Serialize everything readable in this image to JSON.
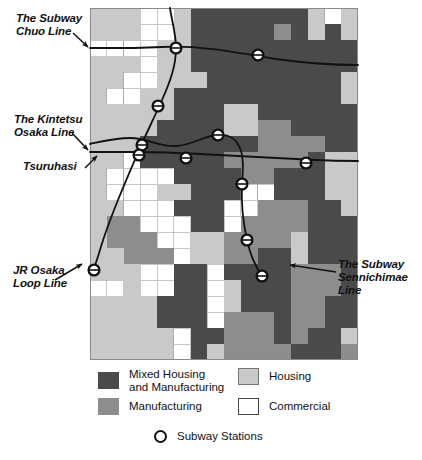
{
  "figure": {
    "map_bounds": {
      "left": 90,
      "top": 8,
      "width": 268,
      "height": 352
    },
    "grid": {
      "cols": 16,
      "rows": 22
    }
  },
  "labels": {
    "chuo": "The Subway\nChuo Line",
    "kintetsu": "The Kintetsu\nOsaka Line",
    "tsuruhasi": "Tsuruhasi",
    "jr_loop": "JR Osaka\nLoop Line",
    "sennichimae": "The Subway\nSennichimae\nLine"
  },
  "legend": {
    "mixed": "Mixed Housing\nand Manufacturing",
    "manufacturing": "Manufacturing",
    "housing": "Housing",
    "commercial": "Commercial",
    "stations": "Subway Stations"
  },
  "colors": {
    "mixed": "#4a4a4a",
    "manufacturing": "#8d8d8d",
    "housing": "#c9c9c9",
    "commercial": "#ffffff",
    "line": "#111111",
    "station_fill": "#ffffff"
  },
  "chart_data": {
    "type": "heatmap",
    "xlabel": "",
    "ylabel": "",
    "categories": [
      "Mixed Housing and Manufacturing",
      "Manufacturing",
      "Housing",
      "Commercial"
    ],
    "category_colors": [
      "#4a4a4a",
      "#8d8d8d",
      "#c9c9c9",
      "#ffffff"
    ],
    "grid_cols": 16,
    "grid_rows": 22,
    "cell_codes_legend": {
      "0": "commercial",
      "1": "housing",
      "2": "manufacturing",
      "3": "mixed"
    },
    "cells": [
      [
        1,
        1,
        1,
        0,
        0,
        1,
        3,
        3,
        3,
        3,
        3,
        3,
        3,
        1,
        0,
        1
      ],
      [
        1,
        1,
        1,
        0,
        0,
        1,
        3,
        3,
        3,
        3,
        3,
        2,
        3,
        1,
        3,
        1
      ],
      [
        0,
        0,
        0,
        0,
        1,
        1,
        3,
        3,
        3,
        3,
        3,
        3,
        3,
        3,
        3,
        3
      ],
      [
        1,
        1,
        1,
        0,
        1,
        1,
        3,
        3,
        3,
        3,
        3,
        3,
        3,
        3,
        3,
        3
      ],
      [
        1,
        1,
        0,
        0,
        1,
        1,
        1,
        3,
        3,
        3,
        3,
        3,
        3,
        3,
        3,
        1
      ],
      [
        1,
        0,
        0,
        1,
        1,
        3,
        3,
        3,
        3,
        3,
        3,
        3,
        3,
        3,
        3,
        1
      ],
      [
        1,
        1,
        1,
        1,
        1,
        3,
        3,
        3,
        1,
        1,
        3,
        3,
        3,
        3,
        3,
        3
      ],
      [
        1,
        1,
        1,
        1,
        3,
        3,
        3,
        3,
        1,
        1,
        2,
        2,
        3,
        3,
        3,
        3
      ],
      [
        1,
        1,
        1,
        3,
        3,
        3,
        3,
        3,
        3,
        3,
        2,
        2,
        2,
        2,
        3,
        3
      ],
      [
        1,
        1,
        0,
        3,
        3,
        3,
        3,
        3,
        2,
        2,
        2,
        2,
        2,
        3,
        1,
        1
      ],
      [
        1,
        0,
        0,
        0,
        0,
        3,
        3,
        3,
        3,
        2,
        2,
        3,
        3,
        3,
        1,
        1
      ],
      [
        1,
        0,
        0,
        0,
        1,
        1,
        3,
        3,
        3,
        0,
        0,
        3,
        3,
        3,
        1,
        1
      ],
      [
        1,
        1,
        0,
        0,
        0,
        3,
        3,
        3,
        0,
        0,
        2,
        2,
        2,
        3,
        3,
        1
      ],
      [
        1,
        2,
        2,
        0,
        0,
        0,
        3,
        3,
        0,
        2,
        2,
        2,
        2,
        3,
        3,
        3
      ],
      [
        1,
        2,
        2,
        2,
        0,
        0,
        1,
        1,
        2,
        2,
        2,
        2,
        1,
        3,
        3,
        3
      ],
      [
        1,
        1,
        2,
        2,
        2,
        0,
        1,
        1,
        2,
        2,
        3,
        3,
        1,
        3,
        3,
        3
      ],
      [
        1,
        1,
        1,
        0,
        0,
        3,
        3,
        0,
        3,
        3,
        3,
        3,
        2,
        2,
        2,
        3
      ],
      [
        0,
        0,
        1,
        0,
        0,
        3,
        3,
        0,
        1,
        3,
        3,
        3,
        2,
        2,
        2,
        3
      ],
      [
        1,
        1,
        1,
        1,
        3,
        3,
        3,
        0,
        1,
        3,
        3,
        3,
        2,
        2,
        3,
        3
      ],
      [
        1,
        1,
        1,
        1,
        3,
        3,
        3,
        0,
        2,
        2,
        2,
        3,
        2,
        2,
        3,
        3
      ],
      [
        1,
        1,
        1,
        1,
        1,
        0,
        3,
        3,
        2,
        2,
        2,
        3,
        2,
        3,
        3,
        1
      ],
      [
        1,
        1,
        1,
        1,
        1,
        0,
        3,
        1,
        2,
        2,
        2,
        2,
        3,
        3,
        3,
        2
      ]
    ],
    "lines": [
      {
        "name": "The Subway Chuo Line",
        "stations": 2
      },
      {
        "name": "The Kintetsu Osaka Line",
        "stations": 3
      },
      {
        "name": "Tsuruhasi",
        "stations": 1
      },
      {
        "name": "JR Osaka Loop Line",
        "stations": 1
      },
      {
        "name": "The Subway Sennichimae Line",
        "stations": 2
      }
    ],
    "station_count": 11
  }
}
